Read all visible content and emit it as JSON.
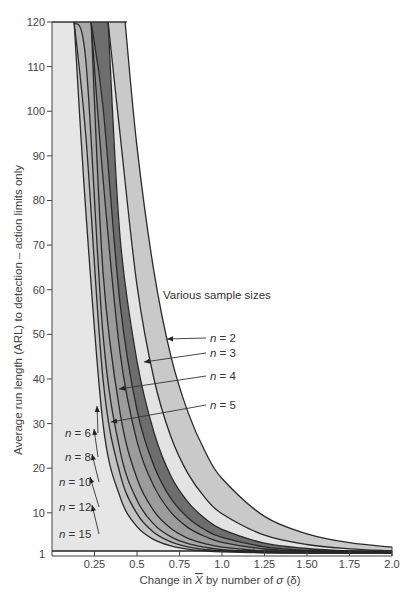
{
  "chart_data": {
    "type": "area",
    "title": "",
    "xlabel": "Change in X̄ by number of σ (δ)",
    "ylabel": "Average run length (ARL) to detection – action limits only",
    "xlim": [
      0,
      2.0
    ],
    "ylim": [
      1,
      120
    ],
    "x_ticks": [
      "0.25",
      "0.5",
      "0.75",
      "1.0",
      "1.25",
      "1.50",
      "1.75",
      "2.0"
    ],
    "x_tick_values": [
      0.25,
      0.5,
      0.75,
      1.0,
      1.25,
      1.5,
      1.75,
      2.0
    ],
    "y_ticks": [
      "1",
      "10",
      "20",
      "30",
      "40",
      "50",
      "60",
      "70",
      "80",
      "90",
      "100",
      "110",
      "120"
    ],
    "y_tick_values": [
      1,
      10,
      20,
      30,
      40,
      50,
      60,
      70,
      80,
      90,
      100,
      110,
      120
    ],
    "grid": false,
    "annotation": "Various sample sizes",
    "x": [
      0.1,
      0.2,
      0.3,
      0.4,
      0.5,
      0.6,
      0.7,
      0.8,
      0.9,
      1.0,
      1.25,
      1.5,
      1.75,
      2.0
    ],
    "series": [
      {
        "name": "n = 2",
        "label_side": "right",
        "fill": "#c9c9c9",
        "values": [
          120,
          120,
          120,
          120,
          92,
          64,
          45,
          32.5,
          23.8,
          17.7,
          9.2,
          5.3,
          3.3,
          2.3
        ]
      },
      {
        "name": "n = 3",
        "label_side": "right",
        "fill": "#e3e3e3",
        "values": [
          120,
          120,
          120,
          95,
          61,
          40,
          27,
          18.8,
          13.4,
          9.8,
          5.0,
          2.9,
          1.95,
          1.47
        ]
      },
      {
        "name": "n = 4",
        "label_side": "right",
        "fill": "#6e6e6e",
        "values": [
          120,
          120,
          120,
          72,
          44,
          28,
          18.2,
          12.4,
          8.7,
          6.3,
          3.2,
          2.0,
          1.45,
          1.19
        ]
      },
      {
        "name": "n = 5",
        "label_side": "right",
        "fill": "#8c8c8c",
        "values": [
          120,
          120,
          101,
          57,
          33,
          20.5,
          13.2,
          8.9,
          6.2,
          4.5,
          2.4,
          1.57,
          1.22,
          1.08
        ]
      },
      {
        "name": "n = 6",
        "label_side": "left",
        "fill": "#9c9c9c",
        "values": [
          120,
          120,
          85,
          46,
          26,
          15.9,
          10.1,
          6.7,
          4.7,
          3.4,
          1.9,
          1.33,
          1.11,
          1.03
        ]
      },
      {
        "name": "n = 8",
        "label_side": "left",
        "fill": "#a9a9a9",
        "values": [
          120,
          120,
          64,
          32.5,
          17.7,
          10.4,
          6.5,
          4.3,
          3.1,
          2.3,
          1.42,
          1.12,
          1.03,
          1.0
        ]
      },
      {
        "name": "n = 10",
        "label_side": "left",
        "fill": "#b6b6b6",
        "values": [
          120,
          111,
          50,
          24,
          12.8,
          7.4,
          4.6,
          3.1,
          2.3,
          1.77,
          1.2,
          1.04,
          1.0,
          1.0
        ]
      },
      {
        "name": "n = 12",
        "label_side": "left",
        "fill": "#c4c4c4",
        "values": [
          120,
          94,
          40,
          18.8,
          9.8,
          5.6,
          3.5,
          2.4,
          1.83,
          1.47,
          1.1,
          1.02,
          1.0,
          1.0
        ]
      },
      {
        "name": "n = 15",
        "label_side": "left",
        "fill": "#e6e6e6",
        "values": [
          120,
          77,
          30,
          13.6,
          6.9,
          4.0,
          2.6,
          1.85,
          1.46,
          1.24,
          1.05,
          1.0,
          1.0,
          1.0
        ]
      }
    ]
  },
  "labels": {
    "annotation": "Various sample sizes",
    "xlabel_prefix": "Change in ",
    "xlabel_var": "X",
    "xlabel_suffix": " by number of ",
    "xlabel_sigma": "σ",
    "xlabel_delta": " (δ)",
    "ylabel": "Average run length (ARL) to detection – action limits only",
    "n_italic": "n",
    "n_values": [
      "= 2",
      "= 3",
      "= 4",
      "= 5",
      "= 6",
      "= 8",
      "= 10",
      "= 12",
      "= 15"
    ]
  }
}
